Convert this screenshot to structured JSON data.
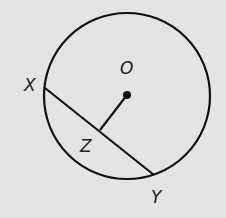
{
  "diagram": {
    "type": "circle-geometry",
    "background": "#e4e4e4",
    "stroke": "#111111",
    "circle": {
      "center_label": "O",
      "cx": 127,
      "cy": 96,
      "r": 83
    },
    "points": {
      "O": {
        "label": "O",
        "x": 127,
        "y": 95
      },
      "X": {
        "label": "X",
        "x": 45,
        "y": 88
      },
      "Y": {
        "label": "Y",
        "x": 154,
        "y": 175
      },
      "Z": {
        "label": "Z",
        "x": 101,
        "y": 130
      }
    },
    "segments": [
      {
        "name": "chord-XY",
        "from": "X",
        "to": "Y"
      },
      {
        "name": "segment-OZ",
        "from": "O",
        "to": "Z"
      }
    ],
    "labels": {
      "O": "O",
      "X": "X",
      "Y": "Y",
      "Z": "Z"
    }
  }
}
